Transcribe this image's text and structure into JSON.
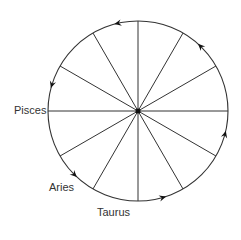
{
  "diagram": {
    "title": "",
    "center": {
      "x": 138,
      "y": 111
    },
    "radius": 90,
    "spoke_count": 12,
    "colors": {
      "stroke": "#333333",
      "text": "#333333",
      "background": "#ffffff"
    },
    "arrow_angles_deg": [
      103,
      46,
      163,
      -15,
      -135,
      -74
    ],
    "direction": "counterclockwise",
    "labels": [
      {
        "text": "Pisces",
        "x": 14,
        "y": 105
      },
      {
        "text": "Aries",
        "x": 49,
        "y": 182
      },
      {
        "text": "Taurus",
        "x": 97,
        "y": 207
      }
    ]
  }
}
